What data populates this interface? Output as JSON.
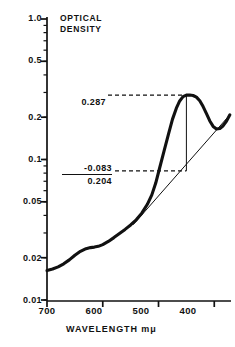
{
  "chart_data": {
    "type": "line",
    "title": "OPTICAL DENSITY",
    "title_lines": [
      "OPTICAL",
      "DENSITY"
    ],
    "xlabel": "WAVELENGTH  mμ",
    "ylabel": "OPTICAL DENSITY",
    "yscale": "log",
    "ylim": [
      0.01,
      1.0
    ],
    "xlim": [
      700,
      370
    ],
    "x_axis_direction": "descending",
    "grid": false,
    "legend": null,
    "ytick_labels": [
      "1.0",
      "0.5",
      "0.2",
      "0.1",
      "0.05",
      "0.02",
      "0.01"
    ],
    "ytick_values": [
      1.0,
      0.5,
      0.2,
      0.1,
      0.05,
      0.02,
      0.01
    ],
    "xtick_labels": [
      "700",
      "600",
      "500",
      "400"
    ],
    "xtick_values": [
      700,
      600,
      500,
      400
    ],
    "series": [
      {
        "name": "absorption-spectrum",
        "style": "thick-solid",
        "x": [
          700,
          690,
          680,
          670,
          660,
          650,
          640,
          630,
          622,
          615,
          608,
          600,
          590,
          580,
          570,
          560,
          550,
          540,
          530,
          520,
          512,
          505,
          498,
          490,
          482,
          475,
          468,
          462,
          456,
          450,
          444,
          438,
          432,
          426,
          420,
          414,
          408,
          402,
          396,
          390,
          384,
          378,
          372
        ],
        "y": [
          0.0162,
          0.0166,
          0.0172,
          0.0181,
          0.0193,
          0.0208,
          0.0222,
          0.0232,
          0.0236,
          0.0238,
          0.0241,
          0.0248,
          0.0261,
          0.0278,
          0.0297,
          0.0318,
          0.0342,
          0.0372,
          0.0415,
          0.048,
          0.056,
          0.068,
          0.087,
          0.115,
          0.152,
          0.193,
          0.232,
          0.261,
          0.28,
          0.287,
          0.288,
          0.2855,
          0.278,
          0.262,
          0.238,
          0.212,
          0.188,
          0.172,
          0.165,
          0.166,
          0.174,
          0.188,
          0.208
        ]
      },
      {
        "name": "baseline-tangent",
        "style": "thin-solid",
        "x": [
          545,
          372
        ],
        "y": [
          0.0345,
          0.208
        ]
      }
    ],
    "annotations": [
      {
        "name": "peak-optical-density",
        "label": "0.287",
        "value": 0.287,
        "wavelength": 450,
        "leader": "dashed"
      },
      {
        "name": "baseline-optical-density",
        "label": "-0.083",
        "value": 0.083,
        "wavelength": 450,
        "leader": "dashed"
      },
      {
        "name": "corrected-optical-density",
        "label": "0.204",
        "value": 0.204
      }
    ],
    "peak_marker": {
      "name": "peak-drop-line",
      "wavelength": 450,
      "y_top": 0.287,
      "y_bottom": 0.083
    }
  },
  "axes": {
    "y_ticks": [
      {
        "label": "1.0"
      },
      {
        "label": "0.5"
      },
      {
        "label": "0.2"
      },
      {
        "label": "0.1"
      },
      {
        "label": "0.05"
      },
      {
        "label": "0.02"
      },
      {
        "label": "0.01"
      }
    ],
    "x_ticks": [
      {
        "label": "700"
      },
      {
        "label": "600"
      },
      {
        "label": "500"
      },
      {
        "label": "400"
      }
    ],
    "x_title": "WAVELENGTH  mμ"
  },
  "title": {
    "line1": "OPTICAL",
    "line2": "DENSITY"
  },
  "annotations": {
    "peak": "0.287",
    "subtrahend": "-0.083",
    "difference": "0.204"
  },
  "colors": {
    "ink": "#111111",
    "background": "#ffffff"
  }
}
